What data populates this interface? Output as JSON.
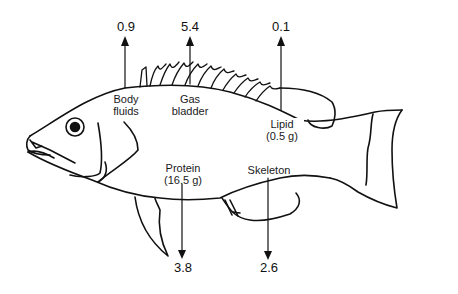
{
  "diagram": {
    "compartments": [
      {
        "id": "body_fluids",
        "label_line1": "Body",
        "label_line2": "fluids",
        "value": "0.9",
        "arrow": "up"
      },
      {
        "id": "gas_bladder",
        "label_line1": "Gas",
        "label_line2": "bladder",
        "value": "5.4",
        "arrow": "up"
      },
      {
        "id": "lipid",
        "label_line1": "Lipid",
        "label_line2": "(0.5 g)",
        "value": "0.1",
        "arrow": "up"
      },
      {
        "id": "protein",
        "label_line1": "Protein",
        "label_line2": "(16.5 g)",
        "value": "3.8",
        "arrow": "down"
      },
      {
        "id": "skeleton",
        "label_line1": "Skeleton",
        "label_line2": "",
        "value": "2.6",
        "arrow": "down"
      }
    ],
    "colors": {
      "line": "#111111",
      "background": "#ffffff"
    }
  }
}
